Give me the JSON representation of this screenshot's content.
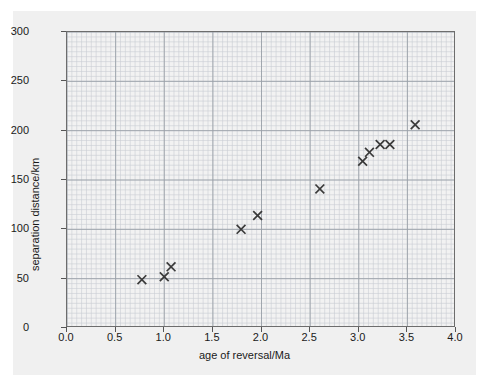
{
  "figure": {
    "background_color": "#f0f0f0",
    "plot_background_color": "#f2f2f2",
    "axis_color": "#6d6d6d",
    "grid_minor_color": "#c9cdd4",
    "grid_major_color": "#9aa0a8",
    "marker_color": "#3a3a3a"
  },
  "chart_data": {
    "type": "scatter",
    "title": "",
    "xlabel": "age of reversal/Ma",
    "ylabel": "separation distance/km",
    "xlim": [
      0.0,
      4.0
    ],
    "ylim": [
      0,
      300
    ],
    "xticks": [
      "0.0",
      "0.5",
      "1.0",
      "1.5",
      "2.0",
      "2.5",
      "3.0",
      "3.5",
      "4.0"
    ],
    "xtick_values": [
      0.0,
      0.5,
      1.0,
      1.5,
      2.0,
      2.5,
      3.0,
      3.5,
      4.0
    ],
    "yticks": [
      "0",
      "50",
      "100",
      "150",
      "200",
      "250",
      "300"
    ],
    "ytick_values": [
      0,
      50,
      100,
      150,
      200,
      250,
      300
    ],
    "grid": true,
    "grid_minor_step_x": 0.05,
    "grid_minor_step_y": 5,
    "grid_major_step_x": 0.5,
    "grid_major_step_y": 50,
    "legend": null,
    "marker": "x",
    "x": [
      0.77,
      1.0,
      1.07,
      1.79,
      1.96,
      2.6,
      3.04,
      3.11,
      3.22,
      3.32,
      3.58
    ],
    "y": [
      49,
      52,
      62,
      100,
      114,
      141,
      169,
      178,
      186,
      186,
      206
    ],
    "points": [
      {
        "x": 0.77,
        "y": 49
      },
      {
        "x": 1.0,
        "y": 52
      },
      {
        "x": 1.07,
        "y": 62
      },
      {
        "x": 1.79,
        "y": 100
      },
      {
        "x": 1.96,
        "y": 114
      },
      {
        "x": 2.6,
        "y": 141
      },
      {
        "x": 3.04,
        "y": 169
      },
      {
        "x": 3.11,
        "y": 178
      },
      {
        "x": 3.22,
        "y": 186
      },
      {
        "x": 3.32,
        "y": 186
      },
      {
        "x": 3.58,
        "y": 206
      }
    ]
  }
}
